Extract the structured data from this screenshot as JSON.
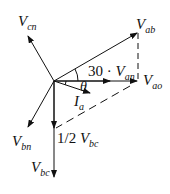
{
  "diagram": {
    "labels": {
      "vcn": {
        "main": "V",
        "sub": "cn"
      },
      "vab": {
        "main": "V",
        "sub": "ab"
      },
      "vao": {
        "main": "V",
        "sub": "ao"
      },
      "van": {
        "prefix": "30 · ",
        "main": "V",
        "sub": "an"
      },
      "theta": "θ",
      "ia": {
        "main": "I",
        "sub": "a"
      },
      "vbn": {
        "main": "V",
        "sub": "bn"
      },
      "half_vbc": {
        "prefix": "1/2 ",
        "main": "V",
        "sub": "bc"
      },
      "vbc": {
        "main": "V",
        "sub": "bc"
      }
    },
    "colors": {
      "line": "#111111",
      "background": "#ffffff"
    }
  }
}
